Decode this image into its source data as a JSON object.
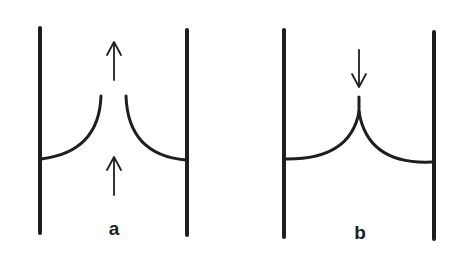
{
  "figure": {
    "panels": [
      {
        "id": "a",
        "label": "a",
        "walls": [
          {
            "x": 40,
            "y1": 28,
            "y2": 233
          },
          {
            "x": 187,
            "y1": 30,
            "y2": 235
          }
        ],
        "menisci": [
          {
            "side": "left",
            "from": [
              41,
              159
            ],
            "to": [
              101,
              96
            ],
            "shape": "concave-up, open at top (gap)"
          },
          {
            "side": "right",
            "from": [
              126,
              96
            ],
            "to": [
              186,
              160
            ],
            "shape": "concave-up, open at top (gap)"
          }
        ],
        "arrows": [
          {
            "direction": "up",
            "x": 114,
            "tail_y": 80,
            "tip_y": 42,
            "position": "above gap"
          },
          {
            "direction": "up",
            "x": 114,
            "tail_y": 195,
            "tip_y": 157,
            "position": "below menisci"
          }
        ]
      },
      {
        "id": "b",
        "label": "b",
        "walls": [
          {
            "x": 284,
            "y1": 30,
            "y2": 237
          },
          {
            "x": 434,
            "y1": 32,
            "y2": 239
          }
        ],
        "menisci": [
          {
            "side": "left",
            "from": [
              285,
              159
            ],
            "to": [
              359,
              112
            ],
            "shape": "concave-up, joined at cusp"
          },
          {
            "side": "right",
            "from": [
              359,
              112
            ],
            "to": [
              432,
              162
            ],
            "shape": "concave-up, joined at cusp"
          }
        ],
        "cusp": {
          "x": 359,
          "y_base": 112,
          "y_tip": 96
        },
        "arrows": [
          {
            "direction": "down",
            "x": 359,
            "tail_y": 50,
            "tip_y": 86,
            "position": "above cusp"
          }
        ]
      }
    ],
    "colors": {
      "ink": "#1e1e1e",
      "background": "#ffffff"
    }
  }
}
